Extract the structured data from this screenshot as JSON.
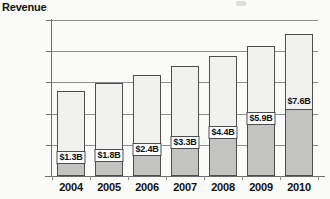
{
  "chart_data": {
    "type": "bar",
    "title": "",
    "xlabel": "",
    "ylabel": "Revenue",
    "ylim": [
      0,
      10
    ],
    "grid": true,
    "legend": null,
    "stacked": true,
    "categories": [
      "2004",
      "2005",
      "2006",
      "2007",
      "2008",
      "2009",
      "2010"
    ],
    "y_tick_labels": [
      "$10B",
      "8",
      "6",
      "4",
      "2",
      "0"
    ],
    "y_tick_values": [
      10,
      8,
      6,
      4,
      2,
      0
    ],
    "series": [
      {
        "name": "lower-segment",
        "values": [
          0.8,
          0.9,
          1.3,
          1.7,
          2.35,
          3.25,
          4.2
        ]
      },
      {
        "name": "upper-segment",
        "values": [
          4.65,
          5.05,
          5.15,
          5.35,
          5.35,
          5.1,
          4.9
        ]
      }
    ],
    "totals": [
      5.45,
      5.95,
      6.45,
      7.05,
      7.7,
      8.35,
      9.1
    ],
    "annotations": [
      "$1.3B",
      "$1.8B",
      "$2.4B",
      "$3.3B",
      "$4.4B",
      "$5.9B",
      "$7.6B"
    ],
    "annotation_values": [
      1.3,
      1.8,
      2.4,
      3.3,
      4.4,
      5.9,
      7.6
    ],
    "colors": {
      "lower_fill": "#c3c3c1",
      "upper_fill": "#f1f1ef",
      "outline": "#4d4d4d",
      "gridline": "#8e8e8e",
      "axis": "#6d6d6d",
      "text": "#111111",
      "background": "#fbfbfa"
    }
  }
}
